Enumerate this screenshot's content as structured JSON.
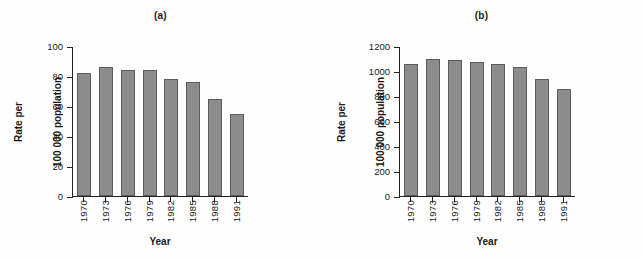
{
  "figure": {
    "background_color": "#fefefe",
    "bar_color": "#8c8c8c",
    "bar_edge_color": "#5c5c5c",
    "axis_color": "#222222"
  },
  "chart_data": [
    {
      "type": "bar",
      "panel_label": "(a)",
      "title": "(a)",
      "categories": [
        "1970",
        "1973",
        "1976",
        "1979",
        "1982",
        "1985",
        "1988",
        "1991"
      ],
      "values": [
        82,
        86,
        84,
        84,
        78,
        76,
        65,
        55
      ],
      "xlabel": "Year",
      "ylabel": "Rate per\n100 000 population",
      "ylabel_line1": "Rate per",
      "ylabel_line2": "100 000 population",
      "ylim": [
        0,
        100
      ],
      "yticks": [
        0,
        20,
        40,
        60,
        80,
        100
      ],
      "ytick_labels": [
        "0",
        "20",
        "40",
        "60",
        "80",
        "100"
      ],
      "grid": false,
      "legend": null
    },
    {
      "type": "bar",
      "panel_label": "(b)",
      "title": "(b)",
      "categories": [
        "1970",
        "1973",
        "1976",
        "1979",
        "1982",
        "1985",
        "1988",
        "1991"
      ],
      "values": [
        1060,
        1100,
        1085,
        1075,
        1055,
        1035,
        935,
        860
      ],
      "xlabel": "Year",
      "ylabel": "Rate per\n100 000 population",
      "ylabel_line1": "Rate per",
      "ylabel_line2": "100 000 population",
      "ylim": [
        0,
        1200
      ],
      "yticks": [
        0,
        200,
        400,
        600,
        800,
        1000,
        1200
      ],
      "ytick_labels": [
        "0",
        "200",
        "400",
        "600",
        "800",
        "1000",
        "1200"
      ],
      "grid": false,
      "legend": null
    }
  ]
}
